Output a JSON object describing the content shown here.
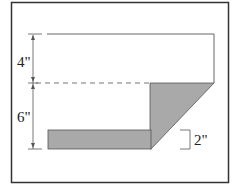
{
  "diagram": {
    "type": "cross-section dimension drawing",
    "labels": {
      "top_height": "4\"",
      "bottom_height": "6\"",
      "bar_thickness": "2\""
    },
    "colors": {
      "frame": "#333333",
      "line": "#555555",
      "shade": "#a9a9a9",
      "background": "#ffffff"
    }
  }
}
